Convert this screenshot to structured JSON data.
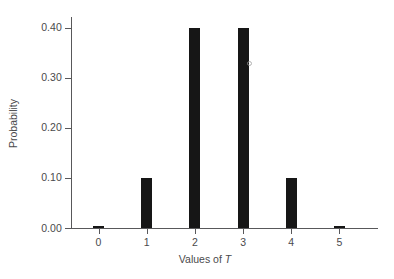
{
  "chart_data": {
    "type": "bar",
    "title": "",
    "xlabel": "Values of T",
    "xlabel_variable": "T",
    "ylabel": "Probability",
    "categories": [
      "0",
      "1",
      "2",
      "3",
      "4",
      "5"
    ],
    "values": [
      0.005,
      0.1,
      0.4,
      0.4,
      0.1,
      0.005
    ],
    "xtick_labels": [
      "0",
      "1",
      "2",
      "3",
      "4",
      "5"
    ],
    "ytick_labels": [
      "0.00",
      "0.10",
      "0.20",
      "0.30",
      "0.40"
    ],
    "ytick_values": [
      0.0,
      0.1,
      0.2,
      0.3,
      0.4
    ],
    "ylim": [
      0.0,
      0.4175
    ],
    "xlim": [
      -0.55,
      5.8
    ],
    "grid": false,
    "legend": null,
    "bar_color": "#161616",
    "axis_color": "#58585a",
    "text_color": "#4a4a4c",
    "background": "#ffffff"
  }
}
